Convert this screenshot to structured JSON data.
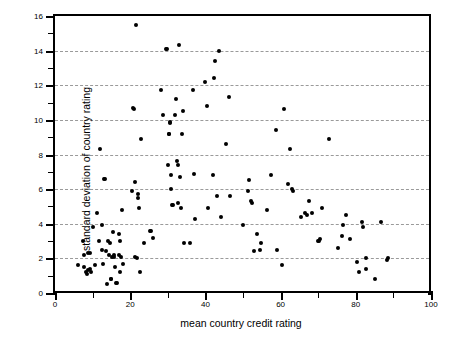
{
  "chart_data": {
    "type": "scatter",
    "title": "",
    "xlabel": "mean country credit rating",
    "ylabel": "standard deviation of country rating",
    "xlim": [
      0,
      100
    ],
    "ylim": [
      0,
      16
    ],
    "x_tick_step": 10,
    "x_tick_label_step": 20,
    "x_tick_labels": [
      "0",
      "20",
      "40",
      "60",
      "80",
      "100"
    ],
    "x_tick_label_values": [
      0,
      20,
      40,
      60,
      80,
      100
    ],
    "y_tick_step": 1,
    "y_tick_label_step": 2,
    "y_tick_labels": [
      "0",
      "2",
      "4",
      "6",
      "8",
      "10",
      "12",
      "14",
      "16"
    ],
    "y_tick_label_values": [
      0,
      2,
      4,
      6,
      8,
      10,
      12,
      14,
      16
    ],
    "grid": "horizontal-dashed",
    "gridline_values": [
      2,
      4,
      6,
      8,
      10,
      12,
      14
    ],
    "legend": "none",
    "marker": "filled-circle",
    "marker_color": "#000000",
    "points": [
      [
        6.0,
        1.6
      ],
      [
        7.4,
        3.0
      ],
      [
        7.6,
        2.2
      ],
      [
        7.8,
        1.5
      ],
      [
        8.3,
        1.2
      ],
      [
        8.6,
        1.1
      ],
      [
        8.7,
        2.3
      ],
      [
        8.9,
        1.3
      ],
      [
        9.2,
        1.4
      ],
      [
        9.4,
        2.3
      ],
      [
        9.6,
        1.2
      ],
      [
        10.2,
        3.8
      ],
      [
        10.6,
        1.6
      ],
      [
        11.2,
        4.6
      ],
      [
        11.6,
        3.0
      ],
      [
        12.0,
        8.3
      ],
      [
        12.4,
        3.9
      ],
      [
        12.6,
        2.5
      ],
      [
        12.8,
        1.7
      ],
      [
        13.0,
        6.6
      ],
      [
        13.4,
        6.6
      ],
      [
        13.6,
        2.4
      ],
      [
        13.9,
        0.5
      ],
      [
        14.2,
        3.0
      ],
      [
        14.4,
        2.2
      ],
      [
        14.6,
        2.9
      ],
      [
        14.8,
        0.8
      ],
      [
        15.0,
        0.8
      ],
      [
        15.2,
        2.1
      ],
      [
        15.4,
        3.5
      ],
      [
        15.6,
        2.2
      ],
      [
        15.8,
        2.1
      ],
      [
        16.0,
        1.5
      ],
      [
        16.2,
        0.6
      ],
      [
        16.6,
        0.6
      ],
      [
        16.9,
        3.4
      ],
      [
        17.0,
        2.2
      ],
      [
        17.2,
        3.0
      ],
      [
        17.4,
        1.2
      ],
      [
        17.6,
        2.1
      ],
      [
        17.8,
        4.8
      ],
      [
        18.2,
        1.7
      ],
      [
        20.4,
        5.9
      ],
      [
        20.8,
        10.7
      ],
      [
        21.0,
        10.6
      ],
      [
        21.2,
        6.4
      ],
      [
        21.3,
        2.1
      ],
      [
        21.5,
        15.5
      ],
      [
        21.8,
        2.0
      ],
      [
        22.0,
        5.7
      ],
      [
        22.2,
        5.5
      ],
      [
        22.4,
        4.9
      ],
      [
        22.6,
        1.2
      ],
      [
        23.0,
        8.9
      ],
      [
        23.6,
        2.9
      ],
      [
        25.2,
        3.6
      ],
      [
        25.6,
        3.6
      ],
      [
        26.0,
        3.2
      ],
      [
        28.2,
        11.7
      ],
      [
        28.6,
        10.3
      ],
      [
        29.4,
        14.1
      ],
      [
        29.8,
        14.1
      ],
      [
        30.0,
        7.4
      ],
      [
        30.2,
        9.2
      ],
      [
        30.4,
        9.2
      ],
      [
        30.6,
        9.8
      ],
      [
        30.7,
        9.9
      ],
      [
        30.8,
        6.8
      ],
      [
        30.9,
        6.0
      ],
      [
        31.0,
        5.1
      ],
      [
        31.4,
        5.1
      ],
      [
        32.0,
        10.3
      ],
      [
        32.2,
        11.2
      ],
      [
        32.4,
        7.6
      ],
      [
        32.6,
        7.4
      ],
      [
        32.8,
        5.2
      ],
      [
        33.0,
        14.3
      ],
      [
        33.2,
        6.7
      ],
      [
        33.4,
        4.9
      ],
      [
        33.8,
        9.2
      ],
      [
        34.0,
        10.5
      ],
      [
        34.4,
        2.9
      ],
      [
        35.8,
        2.9
      ],
      [
        36.6,
        11.7
      ],
      [
        37.0,
        6.9
      ],
      [
        37.2,
        4.3
      ],
      [
        40.0,
        12.2
      ],
      [
        40.4,
        10.8
      ],
      [
        40.8,
        4.9
      ],
      [
        42.0,
        6.8
      ],
      [
        42.2,
        12.4
      ],
      [
        42.6,
        13.4
      ],
      [
        43.0,
        5.6
      ],
      [
        43.6,
        14.0
      ],
      [
        44.2,
        4.4
      ],
      [
        45.4,
        8.6
      ],
      [
        46.2,
        11.3
      ],
      [
        46.6,
        5.6
      ],
      [
        50.0,
        3.9
      ],
      [
        51.2,
        5.9
      ],
      [
        51.6,
        6.5
      ],
      [
        52.2,
        5.3
      ],
      [
        52.4,
        5.2
      ],
      [
        52.8,
        2.4
      ],
      [
        53.8,
        3.4
      ],
      [
        54.6,
        2.5
      ],
      [
        54.8,
        2.9
      ],
      [
        56.4,
        4.8
      ],
      [
        57.4,
        6.8
      ],
      [
        58.8,
        9.4
      ],
      [
        59.0,
        2.5
      ],
      [
        60.4,
        1.6
      ],
      [
        60.8,
        10.6
      ],
      [
        62.0,
        6.3
      ],
      [
        62.4,
        8.3
      ],
      [
        63.0,
        6.0
      ],
      [
        63.4,
        5.9
      ],
      [
        65.4,
        4.4
      ],
      [
        66.6,
        4.6
      ],
      [
        67.0,
        4.5
      ],
      [
        67.6,
        5.3
      ],
      [
        68.4,
        4.6
      ],
      [
        70.0,
        3.0
      ],
      [
        70.2,
        3.0
      ],
      [
        70.4,
        3.1
      ],
      [
        71.0,
        4.9
      ],
      [
        73.0,
        8.9
      ],
      [
        75.2,
        2.6
      ],
      [
        76.2,
        3.3
      ],
      [
        76.6,
        3.9
      ],
      [
        77.4,
        4.5
      ],
      [
        78.4,
        3.1
      ],
      [
        80.4,
        1.8
      ],
      [
        80.8,
        1.2
      ],
      [
        81.6,
        4.1
      ],
      [
        81.8,
        3.8
      ],
      [
        82.6,
        1.4
      ],
      [
        82.8,
        2.0
      ],
      [
        85.0,
        0.8
      ],
      [
        86.8,
        4.1
      ],
      [
        88.4,
        1.9
      ],
      [
        88.6,
        2.0
      ]
    ]
  }
}
